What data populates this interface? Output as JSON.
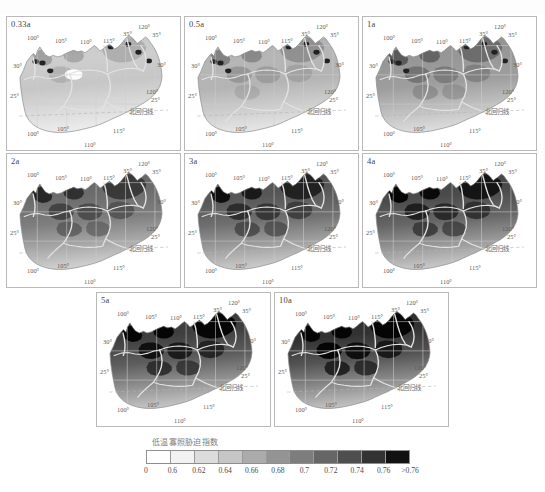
{
  "figure": {
    "top_ghost_text": "",
    "panels": [
      {
        "id": "p1",
        "label": "0.33a",
        "row": 1,
        "col": 1,
        "intensity": 0.18
      },
      {
        "id": "p2",
        "label": "0.5a",
        "row": 1,
        "col": 2,
        "intensity": 0.3
      },
      {
        "id": "p3",
        "label": "1a",
        "row": 1,
        "col": 3,
        "intensity": 0.45
      },
      {
        "id": "p4",
        "label": "2a",
        "row": 2,
        "col": 1,
        "intensity": 0.66
      },
      {
        "id": "p5",
        "label": "3a",
        "row": 2,
        "col": 2,
        "intensity": 0.76
      },
      {
        "id": "p6",
        "label": "4a",
        "row": 2,
        "col": 3,
        "intensity": 0.82
      },
      {
        "id": "p7",
        "label": "5a",
        "row": 3,
        "col": 1,
        "intensity": 0.88
      },
      {
        "id": "p8",
        "label": "10a",
        "row": 3,
        "col": 2,
        "intensity": 0.94
      }
    ],
    "map_annotations": {
      "lon_top": [
        "100°",
        "105°",
        "110°",
        "115°",
        "120°"
      ],
      "lon_bottom": [
        "100°",
        "105°",
        "110°",
        "115°"
      ],
      "lat_left": [
        "30°",
        "25°"
      ],
      "lat_right": [
        "35°",
        "35°",
        "30°",
        "25°"
      ],
      "lon_right": "120°",
      "tropic_label": "北回归线"
    }
  },
  "legend": {
    "title": "低温寡照胁迫指数",
    "ticks": [
      "0",
      "0.6",
      "0.62",
      "0.64",
      "0.66",
      "0.68",
      "0.7",
      "0.72",
      "0.74",
      "0.76",
      ">0.76"
    ],
    "colors": [
      "#ffffff",
      "#f2f2f2",
      "#dcdcdc",
      "#c6c6c6",
      "#ababab",
      "#949494",
      "#7d7d7d",
      "#666666",
      "#4e4e4e",
      "#333333",
      "#111111"
    ]
  }
}
